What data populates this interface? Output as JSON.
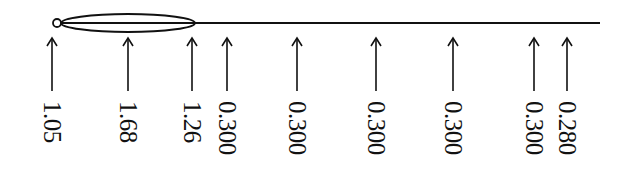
{
  "diagram": {
    "type": "beam-load-diagram",
    "line": {
      "x_start": 60,
      "x_end": 600,
      "y": 23
    },
    "pin": {
      "x": 57,
      "y": 23,
      "r": 4
    },
    "ellipse": {
      "cx": 128,
      "cy": 23,
      "rx": 67,
      "ry": 9
    },
    "arrows": [
      {
        "x": 52,
        "label": "1.05"
      },
      {
        "x": 128,
        "label": "1.68"
      },
      {
        "x": 192,
        "label": "1.26"
      },
      {
        "x": 227,
        "label": "0.300"
      },
      {
        "x": 297,
        "label": "0.300"
      },
      {
        "x": 376,
        "label": "0.300"
      },
      {
        "x": 453,
        "label": "0.300"
      },
      {
        "x": 534,
        "label": "0.300"
      },
      {
        "x": 567,
        "label": "0.280"
      }
    ],
    "stroke_color": "#111111",
    "background": "#ffffff"
  }
}
